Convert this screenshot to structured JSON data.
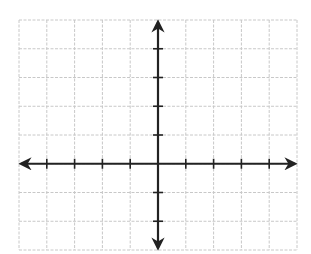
{
  "diagram": {
    "type": "coordinate-plane",
    "grid": {
      "columns": 10,
      "rows": 8,
      "left": 19,
      "top": 20,
      "cell_width": 27.8,
      "cell_height": 28.75,
      "line_color": "#c8c8c8",
      "line_style": "dashed"
    },
    "axes": {
      "color": "#222222",
      "x_axis": {
        "origin_col": 5,
        "ticks_left": 4,
        "ticks_right": 4,
        "arrows": "both"
      },
      "y_axis": {
        "origin_row": 5,
        "ticks_up": 4,
        "ticks_down": 2,
        "arrows": "both"
      },
      "labels": []
    }
  }
}
